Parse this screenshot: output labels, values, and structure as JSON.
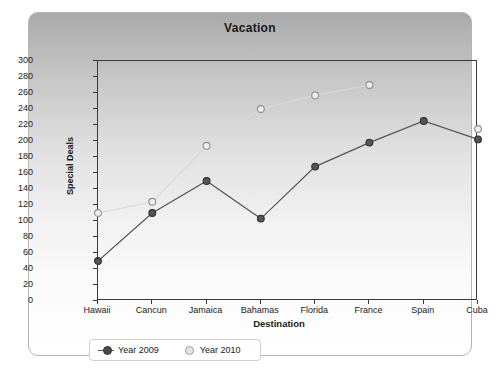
{
  "chart_data": {
    "type": "line",
    "title": "Vacation",
    "xlabel": "Destination",
    "ylabel": "Special Deals",
    "categories": [
      "Hawaii",
      "Cancun",
      "Jamaica",
      "Bahamas",
      "Florida",
      "France",
      "Spain",
      "Cuba"
    ],
    "ylim": [
      0,
      300
    ],
    "ytick_step": 20,
    "yticks": [
      0,
      20,
      40,
      60,
      80,
      100,
      120,
      140,
      160,
      180,
      200,
      220,
      240,
      260,
      280,
      300
    ],
    "grid": false,
    "legend_position": "bottom-left",
    "series": [
      {
        "name": "Year 2009",
        "color": "#555555",
        "values": [
          50,
          110,
          150,
          103,
          168,
          198,
          225,
          202
        ]
      },
      {
        "name": "Year 2010",
        "color": "#d8d8d8",
        "values": [
          110,
          124,
          194,
          240,
          257,
          270,
          null,
          215
        ]
      }
    ]
  },
  "panel": {
    "title": "Vacation"
  },
  "legend": {
    "items": [
      {
        "label": "Year 2009"
      },
      {
        "label": "Year 2010"
      }
    ]
  }
}
